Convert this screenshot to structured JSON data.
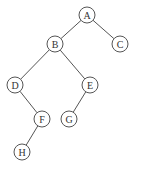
{
  "diagram": {
    "type": "binary-tree",
    "nodes": [
      {
        "id": "A",
        "label": "A",
        "x": 87,
        "y": 15
      },
      {
        "id": "B",
        "label": "B",
        "x": 55,
        "y": 44
      },
      {
        "id": "C",
        "label": "C",
        "x": 120,
        "y": 44
      },
      {
        "id": "D",
        "label": "D",
        "x": 15,
        "y": 85
      },
      {
        "id": "E",
        "label": "E",
        "x": 90,
        "y": 85
      },
      {
        "id": "F",
        "label": "F",
        "x": 42,
        "y": 119
      },
      {
        "id": "G",
        "label": "G",
        "x": 69,
        "y": 119
      },
      {
        "id": "H",
        "label": "H",
        "x": 22,
        "y": 152
      }
    ],
    "edges": [
      {
        "from": "A",
        "to": "B"
      },
      {
        "from": "A",
        "to": "C"
      },
      {
        "from": "B",
        "to": "D"
      },
      {
        "from": "B",
        "to": "E"
      },
      {
        "from": "D",
        "to": "F"
      },
      {
        "from": "E",
        "to": "G"
      },
      {
        "from": "F",
        "to": "H"
      }
    ],
    "colors": {
      "stroke": "#555555",
      "text": "#333333",
      "fill": "#ffffff"
    }
  }
}
